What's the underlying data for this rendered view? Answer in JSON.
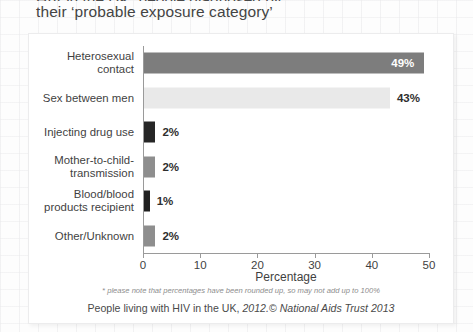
{
  "headline": {
    "clipped_line": "HIV in the UK, people diagnosed by",
    "visible_line": "their ‘probable exposure category’"
  },
  "chart_data": {
    "type": "bar",
    "orientation": "horizontal",
    "title": "their ‘probable exposure category’",
    "categories": [
      "Heterosexual\ncontact",
      "Sex between men",
      "Injecting drug use",
      "Mother-to-child-\ntransmission",
      "Blood/blood\nproducts recipient",
      "Other/Unknown"
    ],
    "values": [
      49,
      43,
      2,
      2,
      1,
      2
    ],
    "value_labels": [
      "49%",
      "43%",
      "2%",
      "2%",
      "1%",
      "2%"
    ],
    "bar_colors": [
      "#7d7d7d",
      "#e9e9e9",
      "#262626",
      "#8e8e8e",
      "#1f1f1f",
      "#8e8e8e"
    ],
    "label_placement": [
      "inside",
      "outside",
      "outside",
      "outside",
      "outside",
      "outside"
    ],
    "xlabel": "Percentage",
    "ylabel": "",
    "xlim": [
      0,
      50
    ],
    "xticks": [
      0,
      10,
      20,
      30,
      40,
      50
    ],
    "xtick_labels": [
      "0",
      "10",
      "20",
      "30",
      "40",
      "50"
    ],
    "grid": false,
    "legend": null
  },
  "footnote": "* please note that percentages have been rounded up, so may not add up to 100%",
  "source": {
    "prefix": "People living with HIV in the UK, ",
    "year_mark": "2012.",
    "copyright_symbol": "©",
    "organisation": " National Aids Trust 2013"
  }
}
